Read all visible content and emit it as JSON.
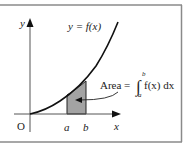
{
  "diagram": {
    "curve_label": "y = f(x)",
    "y_axis_label": "y",
    "x_axis_label": "x",
    "origin_label": "O",
    "lower_bound_label": "a",
    "upper_bound_label": "b",
    "area_label_prefix": "Area =",
    "integral_symbol": "∫",
    "integral_upper": "b",
    "integral_lower": "a",
    "integrand": "f(x) dx",
    "colors": {
      "frame": "#8a8a8a",
      "axes": "#333333",
      "curve": "#111111",
      "shaded_region": "#a3a3a3"
    }
  }
}
